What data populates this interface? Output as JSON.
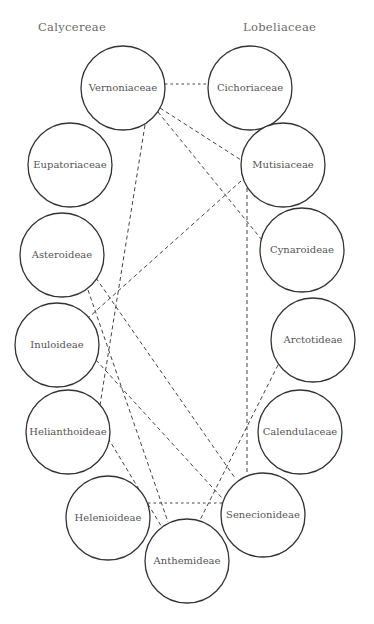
{
  "diagram": {
    "group_titles": [
      {
        "id": "left",
        "label": "Calycereae"
      },
      {
        "id": "right",
        "label": "Lobeliaceae"
      }
    ],
    "nodes": [
      {
        "id": "vernoniaceae",
        "label": "Vernoniaceae"
      },
      {
        "id": "cichoriaceae",
        "label": "Cichoriaceae"
      },
      {
        "id": "eupatoriaceae",
        "label": "Eupatoriaceae"
      },
      {
        "id": "mutisiaceae",
        "label": "Mutisiaceae"
      },
      {
        "id": "asteroideae",
        "label": "Asteroideae"
      },
      {
        "id": "cynaroideae",
        "label": "Cynaroideae"
      },
      {
        "id": "inuloideae",
        "label": "Inuloideae"
      },
      {
        "id": "arctotideae",
        "label": "Arctotideae"
      },
      {
        "id": "helianthoideae",
        "label": "Helianthoideae"
      },
      {
        "id": "calendulaceae",
        "label": "Calendulaceae"
      },
      {
        "id": "helenioideae",
        "label": "Helenioideae"
      },
      {
        "id": "senecionideae",
        "label": "Senecionideae"
      },
      {
        "id": "anthemideae",
        "label": "Anthemideae"
      }
    ],
    "edges": [
      {
        "from": "vernoniaceae",
        "to": "cichoriaceae",
        "style": "dotted"
      },
      {
        "from": "vernoniaceae",
        "to": "mutisiaceae",
        "style": "dashed"
      },
      {
        "from": "vernoniaceae",
        "to": "cynaroideae",
        "style": "dashed"
      },
      {
        "from": "vernoniaceae",
        "to": "helianthoideae",
        "style": "dashed"
      },
      {
        "from": "mutisiaceae",
        "to": "inuloideae",
        "style": "dashed"
      },
      {
        "from": "mutisiaceae",
        "to": "senecionideae",
        "style": "dashed"
      },
      {
        "from": "asteroideae",
        "to": "senecionideae",
        "style": "dashed"
      },
      {
        "from": "asteroideae",
        "to": "anthemideae",
        "style": "dashed"
      },
      {
        "from": "inuloideae",
        "to": "senecionideae",
        "style": "dashed"
      },
      {
        "from": "helianthoideae",
        "to": "anthemideae",
        "style": "dashed"
      },
      {
        "from": "arctotideae",
        "to": "anthemideae",
        "style": "dashed"
      },
      {
        "from": "helenioideae",
        "to": "senecionideae",
        "style": "dotted"
      }
    ]
  }
}
